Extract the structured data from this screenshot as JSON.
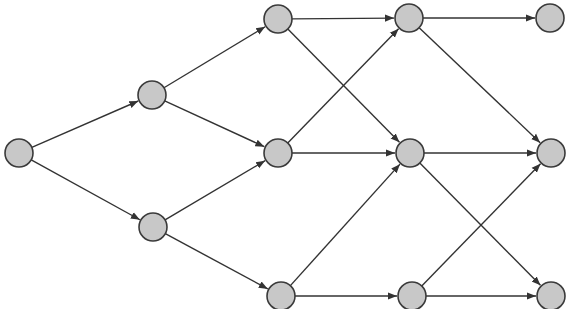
{
  "diagram": {
    "type": "directed-graph",
    "node_radius": 14,
    "colors": {
      "node_fill": "#c8c8c8",
      "node_stroke": "#3a3a3a",
      "edge": "#333333",
      "background": "#ffffff"
    },
    "nodes": [
      {
        "id": "S",
        "x": 19,
        "y": 153
      },
      {
        "id": "A",
        "x": 152,
        "y": 95
      },
      {
        "id": "B",
        "x": 153,
        "y": 227
      },
      {
        "id": "T1",
        "x": 278,
        "y": 19
      },
      {
        "id": "M1",
        "x": 278,
        "y": 153
      },
      {
        "id": "L1",
        "x": 281,
        "y": 296
      },
      {
        "id": "T2",
        "x": 409,
        "y": 18
      },
      {
        "id": "M2",
        "x": 410,
        "y": 153
      },
      {
        "id": "L2",
        "x": 412,
        "y": 296
      },
      {
        "id": "T3",
        "x": 550,
        "y": 18
      },
      {
        "id": "M3",
        "x": 551,
        "y": 153
      },
      {
        "id": "L3",
        "x": 551,
        "y": 296
      }
    ],
    "edges": [
      {
        "from": "S",
        "to": "A"
      },
      {
        "from": "S",
        "to": "B"
      },
      {
        "from": "A",
        "to": "T1"
      },
      {
        "from": "A",
        "to": "M1"
      },
      {
        "from": "B",
        "to": "M1"
      },
      {
        "from": "B",
        "to": "L1"
      },
      {
        "from": "T1",
        "to": "T2"
      },
      {
        "from": "T1",
        "to": "M2"
      },
      {
        "from": "M1",
        "to": "T2"
      },
      {
        "from": "M1",
        "to": "M2"
      },
      {
        "from": "L1",
        "to": "M2"
      },
      {
        "from": "L1",
        "to": "L2"
      },
      {
        "from": "T2",
        "to": "T3"
      },
      {
        "from": "T2",
        "to": "M3"
      },
      {
        "from": "M2",
        "to": "M3"
      },
      {
        "from": "M2",
        "to": "L3"
      },
      {
        "from": "L2",
        "to": "M3"
      },
      {
        "from": "L2",
        "to": "L3"
      }
    ]
  }
}
